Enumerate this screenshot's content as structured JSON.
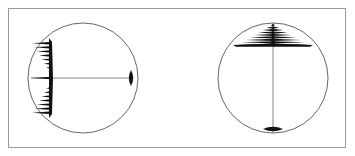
{
  "figure": {
    "frame_color": "#9a9a9a",
    "circle_color": "#555555",
    "line_color": "#777777",
    "pattern_color": "#111111",
    "panels": [
      {
        "id": "left",
        "orientation": "horizontal",
        "circle": {
          "cx": 83,
          "cy": 78,
          "r": 55
        },
        "axis": {
          "x1": 31,
          "y1": 78,
          "x2": 133,
          "y2": 78
        },
        "fan": {
          "apex": 31,
          "base": 52,
          "center": 78,
          "half_extent": 40,
          "fringes": 9
        },
        "spindle": {
          "pos": 131,
          "center": 78,
          "half_length": 8,
          "half_width": 2.2
        }
      },
      {
        "id": "right",
        "orientation": "vertical",
        "circle": {
          "cx": 273,
          "cy": 78,
          "r": 55
        },
        "axis": {
          "x1": 273,
          "y1": 23,
          "x2": 273,
          "y2": 133
        },
        "fan": {
          "apex": 24,
          "base": 46,
          "center": 273,
          "half_extent": 40,
          "fringes": 9
        },
        "spindle": {
          "pos": 129,
          "center": 273,
          "half_length": 10,
          "half_width": 2.2
        }
      }
    ]
  }
}
